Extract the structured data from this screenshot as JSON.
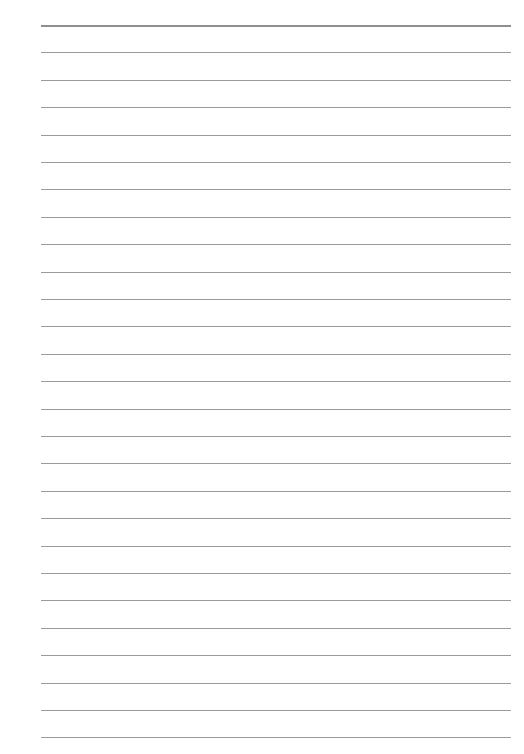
{
  "page": {
    "type": "lined-paper",
    "line_count": 27,
    "first_line_y": 25,
    "line_spacing": 27.4,
    "line_left": 41,
    "line_width": 470,
    "line_color": "#9a9a9a",
    "top_line_color": "#8e8e8e",
    "background": "#ffffff"
  }
}
